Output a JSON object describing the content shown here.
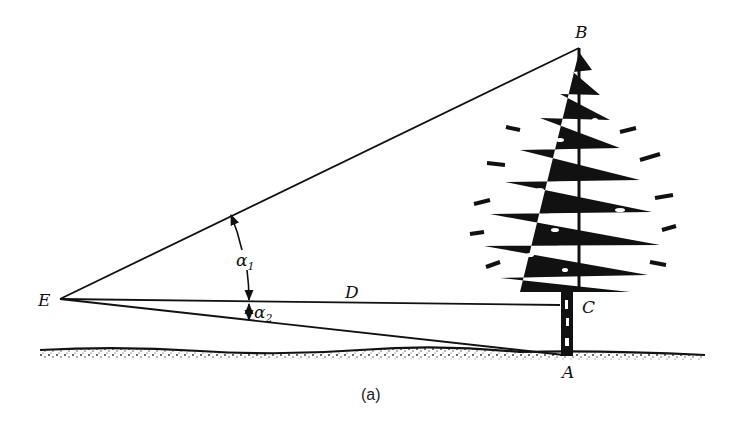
{
  "diagram": {
    "type": "tree height measurement by angles of elevation and depression",
    "points": {
      "E": {
        "label": "E",
        "x": 60,
        "y": 299
      },
      "B": {
        "label": "B",
        "x": 579,
        "y": 48
      },
      "C": {
        "label": "C",
        "x": 560,
        "y": 305
      },
      "A": {
        "label": "A",
        "x": 566,
        "y": 357
      }
    },
    "segments": [
      {
        "from": "E",
        "to": "B"
      },
      {
        "from": "E",
        "to": "C",
        "label": "D"
      },
      {
        "from": "E",
        "to": "A"
      }
    ],
    "angles": [
      {
        "name": "alpha1",
        "symbol": "α",
        "subscript": "1",
        "between": [
          "EC",
          "EB"
        ]
      },
      {
        "name": "alpha2",
        "symbol": "α",
        "subscript": "2",
        "between": [
          "EC",
          "EA"
        ]
      }
    ],
    "distance_label": "D",
    "caption": "(a)"
  }
}
